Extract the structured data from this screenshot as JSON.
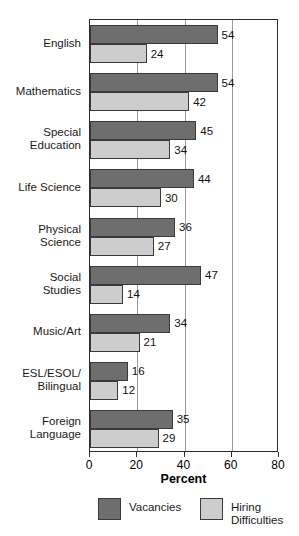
{
  "chart_data": {
    "type": "bar",
    "orientation": "horizontal",
    "title": "",
    "xlabel": "Percent",
    "ylabel": "",
    "xlim": [
      0,
      80
    ],
    "xticks": [
      0,
      20,
      40,
      60,
      80
    ],
    "xtick_labels": [
      "0",
      "20",
      "40",
      "60",
      "80"
    ],
    "grid": true,
    "grid_axis": "x",
    "legend_position": "bottom",
    "categories": [
      "English",
      "Mathematics",
      "Special\nEducation",
      "Life Science",
      "Physical\nScience",
      "Social\nStudies",
      "Music/Art",
      "ESL/ESOL/\nBilingual",
      "Foreign\nLanguage"
    ],
    "series": [
      {
        "name": "Vacancies",
        "color": "#6e6e6e",
        "values": [
          54,
          54,
          45,
          44,
          36,
          47,
          34,
          16,
          35
        ],
        "value_labels": [
          "54",
          "54",
          "45",
          "44",
          "36",
          "47",
          "34",
          "16",
          "35"
        ]
      },
      {
        "name": "Hiring\nDifficulties",
        "color": "#cdcdcd",
        "values": [
          24,
          42,
          34,
          30,
          27,
          14,
          21,
          12,
          29
        ],
        "value_labels": [
          "24",
          "42",
          "34",
          "30",
          "27",
          "14",
          "21",
          "12",
          "29"
        ]
      }
    ]
  },
  "axis": {
    "x_title": "Percent"
  },
  "legend": {
    "entries": [
      {
        "label": "Vacancies",
        "color": "#6e6e6e"
      },
      {
        "label": "Hiring\nDifficulties",
        "color": "#cdcdcd"
      }
    ]
  },
  "colors": {
    "vacancies": "#6e6e6e",
    "hiring_difficulties": "#cdcdcd",
    "frame": "#2b2b2b",
    "gridline": "#9a9a9a",
    "background": "#ffffff"
  }
}
